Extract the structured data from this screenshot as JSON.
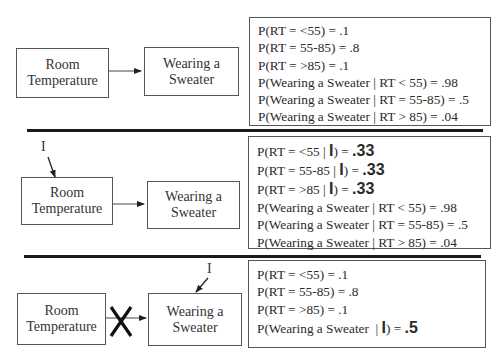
{
  "panels": [
    {
      "nodes": {
        "room_temperature": [
          "Room",
          "Temperature"
        ],
        "wearing_sweater": [
          "Wearing a",
          "Sweater"
        ]
      },
      "probabilities": [
        {
          "prefix": "P(RT = <55) = ",
          "value": ".1"
        },
        {
          "prefix": "P(RT = 55-85) = ",
          "value": ".8"
        },
        {
          "prefix": "P(RT = >85) = ",
          "value": ".1"
        },
        {
          "prefix": "P(Wearing a Sweater | RT < 55) = ",
          "value": ".98"
        },
        {
          "prefix": "P(Wearing a Sweater | RT = 55-85) = ",
          "value": ".5"
        },
        {
          "prefix": "P(Wearing a Sweater | RT > 85) = ",
          "value": ".04"
        }
      ]
    },
    {
      "intervention_label": "I",
      "nodes": {
        "room_temperature": [
          "Room",
          "Temperature"
        ],
        "wearing_sweater": [
          "Wearing a",
          "Sweater"
        ]
      },
      "probabilities": [
        {
          "prefix": "P(RT = <55 | ",
          "bold": "I",
          "mid": ") = ",
          "value": ".33"
        },
        {
          "prefix": "P(RT = 55-85 | ",
          "bold": "I",
          "mid": ") = ",
          "value": ".33"
        },
        {
          "prefix": "P(RT = >85 | ",
          "bold": "I",
          "mid": ") = ",
          "value": ".33"
        },
        {
          "prefix": "P(Wearing a Sweater | RT < 55) = ",
          "value": ".98"
        },
        {
          "prefix": "P(Wearing a Sweater | RT = 55-85) = ",
          "value": ".5"
        },
        {
          "prefix": "P(Wearing a Sweater | RT > 85) = ",
          "value": ".04"
        }
      ]
    },
    {
      "intervention_label": "I",
      "nodes": {
        "room_temperature": [
          "Room",
          "Temperature"
        ],
        "wearing_sweater": [
          "Wearing a",
          "Sweater"
        ]
      },
      "probabilities": [
        {
          "prefix": "P(RT = <55) = ",
          "value": ".1"
        },
        {
          "prefix": "P(RT = 55-85) = ",
          "value": ".8"
        },
        {
          "prefix": "P(RT = >85) = ",
          "value": ".1"
        },
        {
          "prefix": "P(Wearing a Sweater  | ",
          "bold": "I",
          "mid": ") = ",
          "value": ".5"
        }
      ]
    }
  ]
}
